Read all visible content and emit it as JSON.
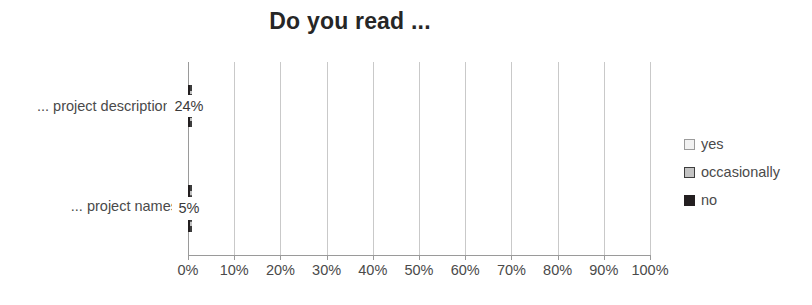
{
  "chart_data": {
    "type": "bar",
    "orientation": "horizontal",
    "stacked": true,
    "stack_total": "100%",
    "title": "Do you read ...",
    "xlabel": "",
    "ylabel": "",
    "xlim": [
      0,
      100
    ],
    "grid": true,
    "legend_position": "right",
    "categories": [
      "... project descriptions",
      "... project names"
    ],
    "xticks": [
      "0%",
      "10%",
      "20%",
      "30%",
      "40%",
      "50%",
      "60%",
      "70%",
      "80%",
      "90%",
      "100%"
    ],
    "xtick_values": [
      0,
      10,
      20,
      30,
      40,
      50,
      60,
      70,
      80,
      90,
      100
    ],
    "series": [
      {
        "name": "yes",
        "color": "#ececec",
        "border": "dotted",
        "values": [
          30,
          56
        ],
        "labels": [
          "30%",
          "56%"
        ]
      },
      {
        "name": "occasionally",
        "color": "#c3c3c3",
        "border": "dashed",
        "values": [
          46,
          39
        ],
        "labels": [
          "46%",
          "39%"
        ]
      },
      {
        "name": "no",
        "color": "#231f20",
        "border": "solid",
        "values": [
          24,
          5
        ],
        "labels": [
          "24%",
          "5%"
        ]
      }
    ]
  },
  "legend": {
    "items": [
      {
        "label": "yes"
      },
      {
        "label": "occasionally"
      },
      {
        "label": "no"
      }
    ]
  }
}
